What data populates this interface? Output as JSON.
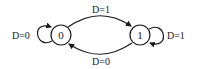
{
  "diagram": {
    "type": "state-diagram",
    "stroke_color": "#1a1a1a",
    "states": [
      {
        "id": "s0",
        "label": "0"
      },
      {
        "id": "s1",
        "label": "1"
      }
    ],
    "transitions": [
      {
        "from": "s0",
        "to": "s0",
        "label": "D=0"
      },
      {
        "from": "s0",
        "to": "s1",
        "label": "D=1"
      },
      {
        "from": "s1",
        "to": "s1",
        "label": "D=1"
      },
      {
        "from": "s1",
        "to": "s0",
        "label": "D=0"
      }
    ]
  }
}
